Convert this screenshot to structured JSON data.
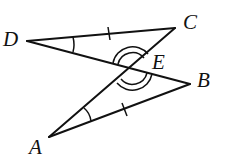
{
  "diagram": {
    "type": "geometry",
    "labels": {
      "A": "A",
      "B": "B",
      "C": "C",
      "D": "D",
      "E": "E"
    },
    "points": {
      "A": [
        49,
        137
      ],
      "B": [
        190,
        84
      ],
      "C": [
        175,
        28
      ],
      "D": [
        27,
        41
      ],
      "E": [
        132,
        69
      ]
    },
    "segments": [
      [
        "D",
        "C"
      ],
      [
        "D",
        "B"
      ],
      [
        "A",
        "C"
      ],
      [
        "A",
        "B"
      ]
    ],
    "marks": {
      "congruent_sides": [
        [
          "D",
          "C"
        ],
        [
          "A",
          "B"
        ]
      ],
      "congruent_angles_single": [
        "D",
        "A"
      ],
      "vertical_angles_double": "E"
    },
    "color": "#111111"
  }
}
